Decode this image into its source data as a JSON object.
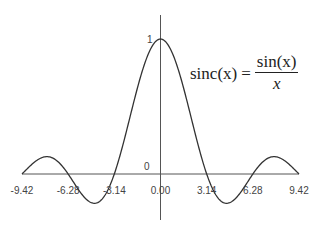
{
  "chart_data": {
    "type": "line",
    "title": "",
    "formula": {
      "lhs": "sinc(x)",
      "equals": "=",
      "numerator": "sin(x)",
      "denominator": "x"
    },
    "xlabel": "",
    "ylabel": "",
    "xlim": [
      -9.42,
      9.42
    ],
    "ylim": [
      -0.22,
      1.0
    ],
    "x_ticks": [
      "-9.42",
      "-6.28",
      "-3.14",
      "0.00",
      "3.14",
      "6.28",
      "9.42"
    ],
    "y_ticks": [
      "0",
      "1"
    ],
    "series": [
      {
        "name": "sinc(x)",
        "function": "sin(x)/x",
        "x_range": [
          -9.42,
          9.42
        ]
      }
    ],
    "grid": false,
    "legend": "none"
  }
}
